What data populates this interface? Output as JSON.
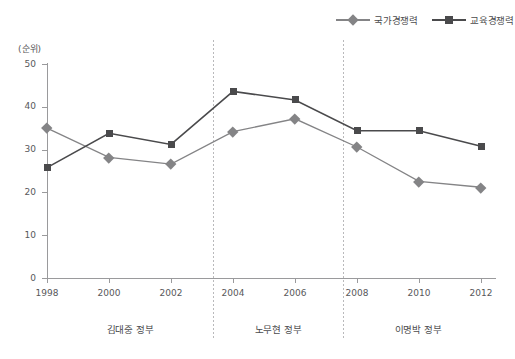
{
  "chart_data": {
    "type": "line",
    "title": "",
    "subtitle": "",
    "xlabel": "",
    "ylabel": "(순위)",
    "y_unit_label": "(순위)",
    "grid": false,
    "legend_position": "top-right",
    "x": [
      "1998",
      "2000",
      "2002",
      "2004",
      "2006",
      "2008",
      "2010",
      "2012"
    ],
    "categories": [
      "1998",
      "2000",
      "2002",
      "2004",
      "2006",
      "2008",
      "2010",
      "2012"
    ],
    "xlim": [
      1998,
      2012
    ],
    "ylim": [
      0,
      50
    ],
    "yticks": [
      "0",
      "10",
      "20",
      "30",
      "40",
      "50"
    ],
    "ytick_values": [
      0,
      10,
      20,
      30,
      40,
      50
    ],
    "series": [
      {
        "name": "국가경쟁력",
        "marker": "diamond",
        "color": "#848486",
        "values": [
          35.0,
          28.2,
          26.6,
          34.2,
          37.2,
          30.6,
          22.6,
          21.2
        ]
      },
      {
        "name": "교육경쟁력",
        "marker": "square",
        "color": "#4a4a4c",
        "values": [
          25.8,
          33.8,
          31.2,
          43.6,
          41.6,
          34.4,
          34.4,
          30.8
        ]
      }
    ],
    "annotations": [
      {
        "type": "vline",
        "at": "2003",
        "style": "dotted"
      },
      {
        "type": "vline",
        "at": "2007.5",
        "style": "dotted"
      }
    ],
    "era_bands": [
      {
        "label": "김대중 정부",
        "from": "1998",
        "to": "2003"
      },
      {
        "label": "노무현 정부",
        "from": "2003",
        "to": "2007.5"
      },
      {
        "label": "이명박 정부",
        "from": "2007.5",
        "to": "2012"
      }
    ]
  },
  "legend": {
    "items": [
      {
        "label": "국가경쟁력",
        "marker": "diamond",
        "color": "#848486"
      },
      {
        "label": "교육경쟁력",
        "marker": "square",
        "color": "#4a4a4c"
      }
    ]
  },
  "colors": {
    "national": "#848486",
    "education": "#4a4a4c",
    "axis": "#9a9a9c",
    "divider": "#b9b9bb",
    "text": "#58585a",
    "background": "#ffffff"
  }
}
